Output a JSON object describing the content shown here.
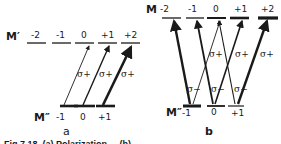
{
  "panel_a": {
    "upper_label": "M′",
    "upper_levels": [
      "-2",
      "-1",
      "0",
      "+1",
      "+2"
    ],
    "lower_label": "M″",
    "lower_levels": [
      "-1",
      "0",
      "+1"
    ],
    "transitions": [
      {
        "from": "-1",
        "to": "0",
        "label": "σ+"
      },
      {
        "from": "0",
        "to": "+1",
        "label": "σ+"
      },
      {
        "from": "+1",
        "to": "+2",
        "label": "σ+"
      }
    ],
    "caption": "a"
  },
  "panel_b": {
    "upper_label": "M",
    "upper_levels": [
      "-2",
      "-1",
      "0",
      "+1",
      "+2"
    ],
    "lower_label": "M″",
    "lower_levels": [
      "-1",
      "0",
      "+1"
    ],
    "transitions": [
      {
        "from": "-1",
        "to": "-2",
        "label": "σ−"
      },
      {
        "from": "0",
        "to": "-1",
        "label": "σ−"
      },
      {
        "from": "+1",
        "to": "0",
        "label": "σ−"
      },
      {
        "from": "-1",
        "to": "0",
        "label": "σ+"
      },
      {
        "from": "0",
        "to": "+1",
        "label": "σ+"
      },
      {
        "from": "+1",
        "to": "+2",
        "label": "σ+"
      }
    ],
    "caption": "b"
  },
  "figure_caption": "Fig.7.18. (a) Polarization ... (b) ..."
}
